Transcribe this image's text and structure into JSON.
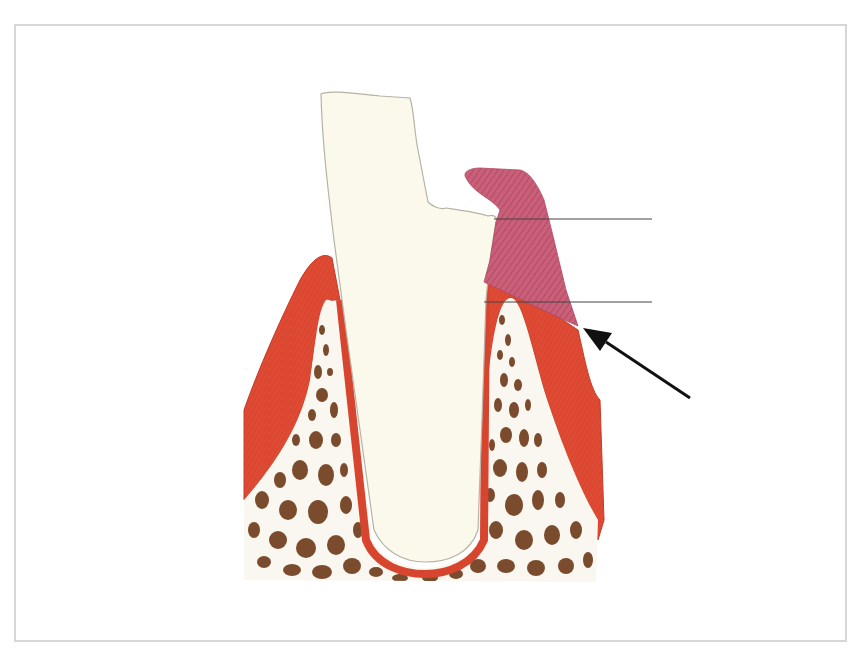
{
  "figure": {
    "colors": {
      "frame_border": "#d6d6d6",
      "tooth": "#fbf8ec",
      "tooth_outline": "#b9b2a6",
      "gingiva": "#de4a33",
      "gingiva_dark": "#c93a26",
      "overgrowth": "#c45a73",
      "overgrowth_hatch": "#a63f5c",
      "bone_bg": "#faf7f0",
      "bone_trabeculae": "#7a4b2c",
      "pdl": "#d8452f",
      "leader_line": "#444444",
      "arrow": "#111111"
    },
    "labels": [
      {
        "id": "label-line-upper",
        "text": ""
      },
      {
        "id": "label-line-lower",
        "text": ""
      }
    ],
    "annotations": {
      "arrow": "arrow pointing to gingival margin"
    }
  }
}
